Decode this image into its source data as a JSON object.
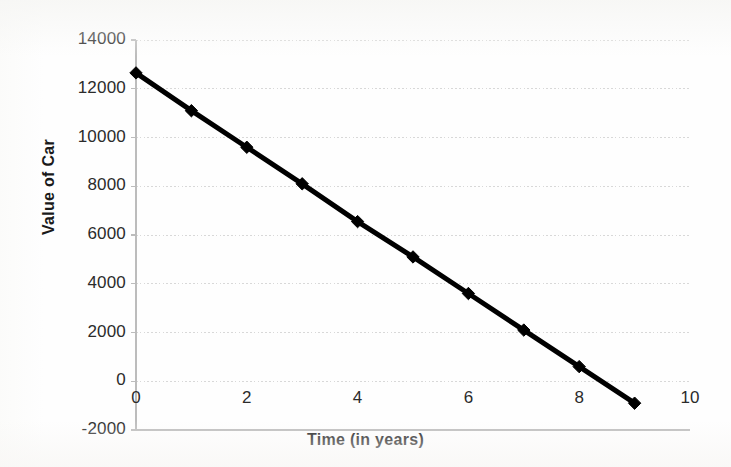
{
  "chart_data": {
    "type": "line",
    "title": "",
    "xlabel": "Time (in years)",
    "ylabel": "Value of Car",
    "x": [
      0,
      1,
      2,
      3,
      4,
      5,
      6,
      7,
      8,
      9
    ],
    "values": [
      12650,
      11100,
      9600,
      8100,
      6550,
      5100,
      3600,
      2100,
      600,
      -900
    ],
    "series": [
      {
        "name": "Value of Car",
        "x": [
          0,
          1,
          2,
          3,
          4,
          5,
          6,
          7,
          8,
          9
        ],
        "values": [
          12650,
          11100,
          9600,
          8100,
          6550,
          5100,
          3600,
          2100,
          600,
          -900
        ],
        "color": "#000000",
        "marker": "diamond",
        "line_width": 5
      }
    ],
    "xlim": [
      0,
      10
    ],
    "ylim": [
      -2000,
      14000
    ],
    "xticks": [
      0,
      2,
      4,
      6,
      8,
      10
    ],
    "xtick_labels": [
      "0",
      "2",
      "4",
      "6",
      "8",
      "10"
    ],
    "yticks": [
      -2000,
      0,
      2000,
      4000,
      6000,
      8000,
      10000,
      12000,
      14000
    ],
    "ytick_labels": [
      "-2000",
      "0",
      "2000",
      "4000",
      "6000",
      "8000",
      "10000",
      "12000",
      "14000"
    ],
    "grid": {
      "horizontal": true,
      "vertical": false,
      "style": "dotted",
      "color": "#d8d8d8"
    },
    "legend": {
      "visible": false,
      "position": "none"
    },
    "annotations": []
  },
  "colors": {
    "series_line": "#000000",
    "axis": "#bcbcbc",
    "gridline": "#d8d8d8",
    "tick_text": "#2b2b2b",
    "axis_title_text": "#1a1a1a",
    "background": "#fefefe"
  }
}
